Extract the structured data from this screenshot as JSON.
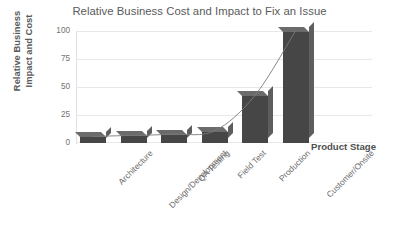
{
  "chart_data": {
    "type": "bar",
    "title": "Relative Business Cost and Impact to Fix an Issue",
    "xlabel": "Product Stage",
    "ylabel": "Relative Business Impact and Cost",
    "ylabel_lines": [
      "Relative Business",
      "Impact and Cost"
    ],
    "categories": [
      "Architecture",
      "Design/Development",
      "QA Testing",
      "Field Test",
      "Production",
      "Customer/Onsite"
    ],
    "values": [
      5,
      6,
      7,
      10,
      42,
      100
    ],
    "ylim": [
      0,
      100
    ],
    "yticks": [
      0,
      25,
      50,
      75,
      100
    ],
    "ytick_labels": [
      "0",
      "25",
      "50",
      "75",
      "100"
    ],
    "grid": true,
    "grid_axis": "y",
    "legend": false,
    "series": [
      {
        "name": "Relative Business Impact and Cost",
        "type": "bar",
        "values": [
          5,
          6,
          7,
          10,
          42,
          100
        ],
        "color": "#464646"
      },
      {
        "name": "Trend",
        "type": "line",
        "values": [
          5,
          6,
          7,
          10,
          42,
          100
        ],
        "color": "#7a7a7a",
        "smooth": true
      }
    ],
    "colors": {
      "bar_face": "#464646",
      "bar_side": "#5e5e5e",
      "bar_top": "#6b6b6b",
      "gridline": "#e8e8e8",
      "text": "#5a5a5a",
      "tick_text": "#727272",
      "background": "#ffffff"
    }
  }
}
